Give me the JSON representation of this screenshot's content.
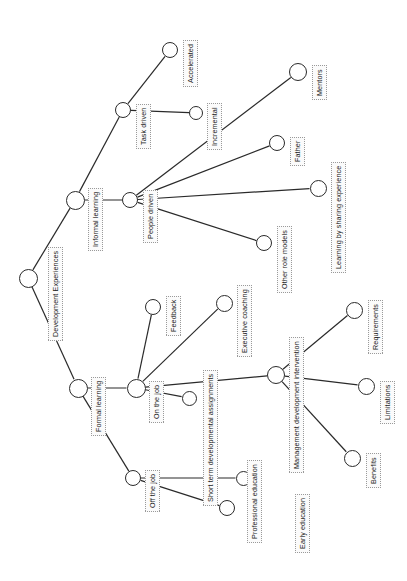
{
  "diagram": {
    "type": "node-link-tree",
    "orientation": "rotated-90-left",
    "canvas": {
      "width": 407,
      "height": 581
    },
    "style": {
      "node_stroke": "#2a2a2a",
      "node_fill": "#ffffff",
      "edge_color": "#2a2a2a",
      "label_border": "#9a9a9a",
      "label_fill": "#fbfbfb",
      "label_text": "#1a1a1a",
      "background": "#ffffff"
    },
    "nodes": [
      {
        "id": "root",
        "label": "Development Experiences",
        "cx": 28,
        "cy": 278,
        "r": 9.5,
        "lx": 48,
        "ly": 341
      },
      {
        "id": "informal",
        "label": "Informal learning",
        "cx": 75,
        "cy": 200,
        "r": 9.5,
        "lx": 88,
        "ly": 251
      },
      {
        "id": "formal",
        "label": "Formal learning",
        "cx": 78,
        "cy": 388,
        "r": 9.5,
        "lx": 91,
        "ly": 436
      },
      {
        "id": "task",
        "label": "Task driven",
        "cx": 123,
        "cy": 110,
        "r": 8.0,
        "lx": 136,
        "ly": 149
      },
      {
        "id": "people",
        "label": "People driven",
        "cx": 130,
        "cy": 200,
        "r": 8.0,
        "lx": 143,
        "ly": 243
      },
      {
        "id": "accel",
        "label": "Accelerated",
        "cx": 170,
        "cy": 50,
        "r": 8.0,
        "lx": 183,
        "ly": 87
      },
      {
        "id": "increm",
        "label": "Incremental",
        "cx": 196,
        "cy": 113,
        "r": 7.0,
        "lx": 207,
        "ly": 150
      },
      {
        "id": "mentors",
        "label": "Mentors",
        "cx": 298,
        "cy": 72,
        "r": 9.0,
        "lx": 312,
        "ly": 100
      },
      {
        "id": "father",
        "label": "Father",
        "cx": 277,
        "cy": 143,
        "r": 8.0,
        "lx": 290,
        "ly": 166
      },
      {
        "id": "sharing",
        "label": "Learning by sharing experience",
        "cx": 318,
        "cy": 188,
        "r": 8.5,
        "lx": 331,
        "ly": 273
      },
      {
        "id": "rolemodels",
        "label": "Other role models",
        "cx": 264,
        "cy": 243,
        "r": 8.0,
        "lx": 277,
        "ly": 293
      },
      {
        "id": "onjob",
        "label": "On the job",
        "cx": 136,
        "cy": 388,
        "r": 9.5,
        "lx": 149,
        "ly": 423
      },
      {
        "id": "offjob",
        "label": "Off the job",
        "cx": 133,
        "cy": 478,
        "r": 8.0,
        "lx": 145,
        "ly": 512
      },
      {
        "id": "feedback",
        "label": "Feedback",
        "cx": 153,
        "cy": 307,
        "r": 8.0,
        "lx": 166,
        "ly": 336
      },
      {
        "id": "execcoach",
        "label": "Executive coaching",
        "cx": 224,
        "cy": 303,
        "r": 8.5,
        "lx": 237,
        "ly": 357
      },
      {
        "id": "shortterm",
        "label": "Short term developmental assignments",
        "cx": 189,
        "cy": 398,
        "r": 7.5,
        "lx": 203,
        "ly": 506
      },
      {
        "id": "mgmtdev",
        "label": "Management development intervention",
        "cx": 276,
        "cy": 375,
        "r": 9.0,
        "lx": 289,
        "ly": 473
      },
      {
        "id": "require",
        "label": "Requirements",
        "cx": 354,
        "cy": 310,
        "r": 8.5,
        "lx": 368,
        "ly": 354
      },
      {
        "id": "limits",
        "label": "Limitations",
        "cx": 366,
        "cy": 386,
        "r": 8.5,
        "lx": 380,
        "ly": 424
      },
      {
        "id": "benefits",
        "label": "Benefits",
        "cx": 352,
        "cy": 458,
        "r": 8.5,
        "lx": 366,
        "ly": 488
      },
      {
        "id": "profedu",
        "label": "Professional education",
        "cx": 243,
        "cy": 478,
        "r": 7.5,
        "lx": 247,
        "ly": 543
      },
      {
        "id": "earlyedu",
        "label": "Early education",
        "cx": 227,
        "cy": 508,
        "r": 8.0,
        "lx": 295,
        "ly": 553
      }
    ],
    "edges": [
      {
        "from": "root",
        "to": "informal"
      },
      {
        "from": "root",
        "to": "formal"
      },
      {
        "from": "informal",
        "to": "task"
      },
      {
        "from": "informal",
        "to": "people"
      },
      {
        "from": "task",
        "to": "accel"
      },
      {
        "from": "task",
        "to": "increm"
      },
      {
        "from": "people",
        "to": "mentors"
      },
      {
        "from": "people",
        "to": "father"
      },
      {
        "from": "people",
        "to": "sharing"
      },
      {
        "from": "people",
        "to": "rolemodels"
      },
      {
        "from": "formal",
        "to": "onjob"
      },
      {
        "from": "formal",
        "to": "offjob"
      },
      {
        "from": "onjob",
        "to": "feedback"
      },
      {
        "from": "onjob",
        "to": "execcoach"
      },
      {
        "from": "onjob",
        "to": "shortterm"
      },
      {
        "from": "onjob",
        "to": "mgmtdev"
      },
      {
        "from": "mgmtdev",
        "to": "require"
      },
      {
        "from": "mgmtdev",
        "to": "limits"
      },
      {
        "from": "mgmtdev",
        "to": "benefits"
      },
      {
        "from": "offjob",
        "to": "profedu"
      },
      {
        "from": "offjob",
        "to": "earlyedu"
      }
    ]
  }
}
